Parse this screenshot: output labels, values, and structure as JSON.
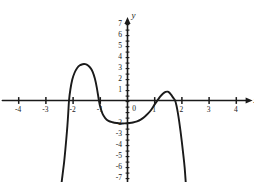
{
  "chart_data": {
    "type": "line",
    "title": "",
    "xlabel": "x",
    "ylabel": "y",
    "xlim": [
      -4.6,
      4.6
    ],
    "ylim": [
      -7.6,
      7.6
    ],
    "grid": false,
    "legend": null,
    "x_ticks": [
      -4,
      -3,
      -2,
      -1,
      1,
      2,
      3,
      4
    ],
    "x_tick_labels": [
      "-4",
      "-3",
      "-2",
      "-1",
      "1",
      "2",
      "3",
      "4"
    ],
    "y_ticks": [
      -7,
      -6,
      -5,
      -4,
      -3,
      -2,
      1,
      2,
      3,
      4,
      5,
      6,
      7
    ],
    "y_tick_labels": [
      "-7",
      "-6",
      "-5",
      "-4",
      "-3",
      "-2",
      "1",
      "2",
      "3",
      "4",
      "5",
      "6",
      "7"
    ],
    "origin_label": "0",
    "minor_tick_step": 0.5,
    "curve_color": "#1a1a1a",
    "axis_color": "#1a1a1a",
    "series": [
      {
        "name": "polynomial",
        "roots": [
          -2.15,
          -1.05,
          1.1,
          1.75
        ],
        "local_maxima": [
          {
            "x": -1.55,
            "y": 3.3
          },
          {
            "x": 1.45,
            "y": 0.8
          }
        ],
        "local_minima": [
          {
            "x": 0.15,
            "y": -2.0
          }
        ],
        "points": [
          {
            "x": -2.42,
            "y": -7.4
          },
          {
            "x": -2.38,
            "y": -6.6
          },
          {
            "x": -2.33,
            "y": -5.6
          },
          {
            "x": -2.29,
            "y": -4.6
          },
          {
            "x": -2.25,
            "y": -3.5
          },
          {
            "x": -2.21,
            "y": -2.3
          },
          {
            "x": -2.18,
            "y": -1.2
          },
          {
            "x": -2.15,
            "y": 0.0
          },
          {
            "x": -2.1,
            "y": 1.0
          },
          {
            "x": -2.03,
            "y": 1.9
          },
          {
            "x": -1.95,
            "y": 2.5
          },
          {
            "x": -1.85,
            "y": 2.95
          },
          {
            "x": -1.75,
            "y": 3.2
          },
          {
            "x": -1.65,
            "y": 3.3
          },
          {
            "x": -1.55,
            "y": 3.3
          },
          {
            "x": -1.45,
            "y": 3.18
          },
          {
            "x": -1.35,
            "y": 2.92
          },
          {
            "x": -1.28,
            "y": 2.6
          },
          {
            "x": -1.2,
            "y": 2.0
          },
          {
            "x": -1.13,
            "y": 1.2
          },
          {
            "x": -1.05,
            "y": 0.0
          },
          {
            "x": -1.0,
            "y": -0.6
          },
          {
            "x": -0.92,
            "y": -1.2
          },
          {
            "x": -0.82,
            "y": -1.6
          },
          {
            "x": -0.7,
            "y": -1.85
          },
          {
            "x": -0.55,
            "y": -1.98
          },
          {
            "x": -0.4,
            "y": -2.05
          },
          {
            "x": -0.25,
            "y": -2.08
          },
          {
            "x": -0.1,
            "y": -2.08
          },
          {
            "x": 0.05,
            "y": -2.05
          },
          {
            "x": 0.2,
            "y": -2.0
          },
          {
            "x": 0.35,
            "y": -1.9
          },
          {
            "x": 0.5,
            "y": -1.72
          },
          {
            "x": 0.62,
            "y": -1.5
          },
          {
            "x": 0.75,
            "y": -1.2
          },
          {
            "x": 0.88,
            "y": -0.82
          },
          {
            "x": 1.0,
            "y": -0.35
          },
          {
            "x": 1.1,
            "y": 0.0
          },
          {
            "x": 1.2,
            "y": 0.35
          },
          {
            "x": 1.3,
            "y": 0.62
          },
          {
            "x": 1.4,
            "y": 0.78
          },
          {
            "x": 1.48,
            "y": 0.8
          },
          {
            "x": 1.56,
            "y": 0.66
          },
          {
            "x": 1.64,
            "y": 0.4
          },
          {
            "x": 1.7,
            "y": 0.18
          },
          {
            "x": 1.75,
            "y": 0.0
          },
          {
            "x": 1.8,
            "y": -0.45
          },
          {
            "x": 1.85,
            "y": -1.1
          },
          {
            "x": 1.9,
            "y": -1.9
          },
          {
            "x": 1.95,
            "y": -2.8
          },
          {
            "x": 2.0,
            "y": -3.8
          },
          {
            "x": 2.05,
            "y": -4.9
          },
          {
            "x": 2.1,
            "y": -6.05
          },
          {
            "x": 2.14,
            "y": -7.4
          }
        ]
      }
    ]
  }
}
